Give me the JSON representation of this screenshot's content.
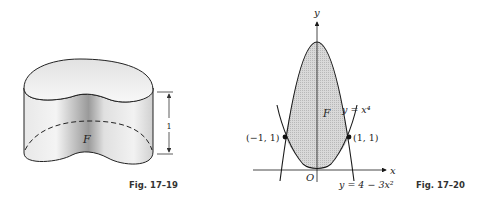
{
  "figures": [
    {
      "id": "fig-17-19",
      "caption": "Fig. 17–19",
      "region_label": "F",
      "height_label": "1",
      "description": "Cylinder of height 1 with kidney-shaped base region F"
    },
    {
      "id": "fig-17-20",
      "caption": "Fig. 17–20",
      "axes": {
        "x_label": "x",
        "y_label": "y",
        "origin_label": "O"
      },
      "region_label": "F",
      "curves": [
        {
          "label": "y = x⁴",
          "equation": "y = x^4"
        },
        {
          "label": "y = 4 − 3x²",
          "equation": "y = 4 - 3x^2"
        }
      ],
      "points": [
        {
          "label": "(−1, 1)",
          "x": -1,
          "y": 1
        },
        {
          "label": "(1, 1)",
          "x": 1,
          "y": 1
        }
      ]
    }
  ],
  "colors": {
    "line": "#1a1a1a",
    "shade": "#d6d6d6",
    "background": "#ffffff"
  }
}
